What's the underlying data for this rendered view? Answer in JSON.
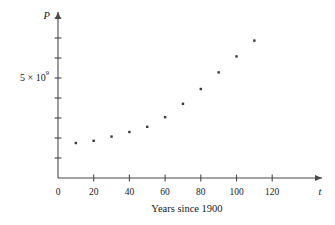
{
  "figure": {
    "background_color": "#ffffff",
    "axis_color": "#4a4a4a",
    "point_color": "#3a3a3a",
    "text_color": "#1a1a1a",
    "x_axis_caption": "Years since 1900",
    "y_axis_variable": "P",
    "x_axis_variable": "t",
    "y_label_mantissa": "5 × 10",
    "y_label_exponent": "9",
    "y_label_full": "5 × 10⁹",
    "origin_label": "0"
  },
  "chart_data": {
    "type": "scatter",
    "title": "",
    "subtitle": "",
    "xlabel": "Years since 1900",
    "ylabel": "P",
    "x_axis_symbol": "t",
    "y_axis_symbol": "P",
    "grid": false,
    "legend": false,
    "legend_position": "none",
    "xlim": [
      0,
      130
    ],
    "ylim": [
      0,
      8600000000
    ],
    "x_ticks": [
      0,
      20,
      40,
      60,
      80,
      100,
      120
    ],
    "x_tick_labels": [
      "0",
      "20",
      "40",
      "60",
      "80",
      "100",
      "120"
    ],
    "y_ticks": [
      1000000000,
      2000000000,
      3000000000,
      4000000000,
      5000000000,
      6000000000,
      7000000000,
      8000000000
    ],
    "y_tick_labels": [
      "",
      "",
      "",
      "",
      "5 × 10⁹",
      "",
      "",
      ""
    ],
    "y_labeled_tick_value": 5000000000,
    "y_labeled_tick_text": "5 × 10⁹",
    "x": [
      10,
      20,
      30,
      40,
      50,
      60,
      70,
      80,
      90,
      100,
      110
    ],
    "y": [
      1750000000,
      1860000000,
      2070000000,
      2300000000,
      2560000000,
      3040000000,
      3710000000,
      4450000000,
      5280000000,
      6080000000,
      6870000000
    ],
    "points": [
      {
        "t": 10,
        "P": 1750000000
      },
      {
        "t": 20,
        "P": 1860000000
      },
      {
        "t": 30,
        "P": 2070000000
      },
      {
        "t": 40,
        "P": 2300000000
      },
      {
        "t": 50,
        "P": 2560000000
      },
      {
        "t": 60,
        "P": 3040000000
      },
      {
        "t": 70,
        "P": 3710000000
      },
      {
        "t": 80,
        "P": 4450000000
      },
      {
        "t": 90,
        "P": 5280000000
      },
      {
        "t": 100,
        "P": 6080000000
      },
      {
        "t": 110,
        "P": 6870000000
      }
    ],
    "marker": "square",
    "marker_size": 2.4,
    "annotations": []
  },
  "geometry": {
    "origin_px": {
      "x": 58,
      "y": 178
    },
    "x_px_per_unit": 1.785,
    "y_px_per_tick": 20.0,
    "y_units_per_tick": 1000000000,
    "x_axis_end_px": 322,
    "y_axis_top_px": 12
  }
}
